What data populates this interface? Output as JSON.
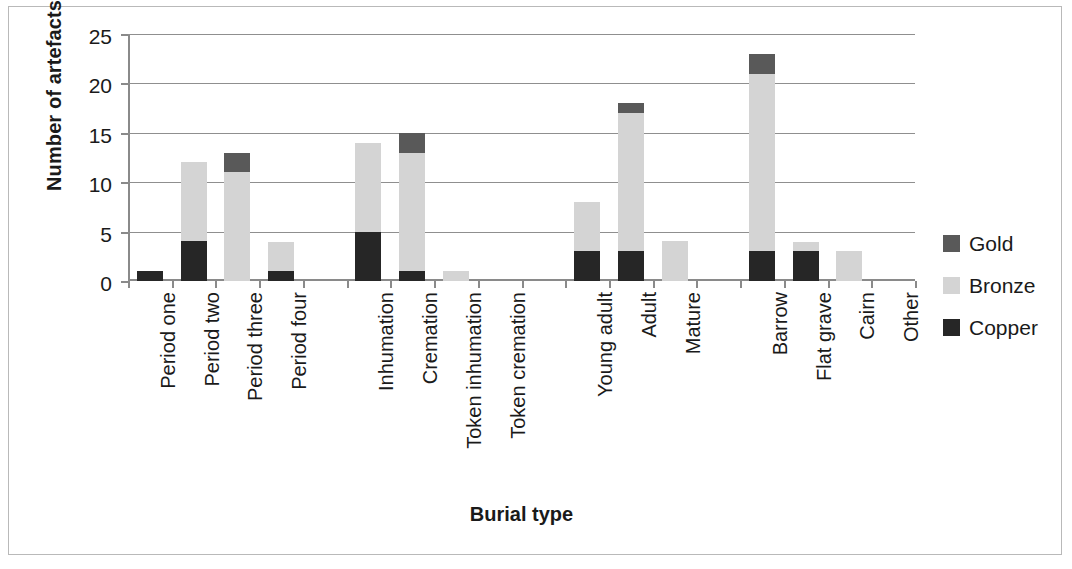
{
  "chart_data": {
    "type": "bar",
    "subtype": "stacked",
    "title": "",
    "xlabel": "Burial type",
    "ylabel": "Number of artefacts",
    "ylim": [
      0,
      25
    ],
    "yticks": [
      0,
      5,
      10,
      15,
      20,
      25
    ],
    "grid": true,
    "legend_position": "right",
    "categories": [
      "Period one",
      "Period two",
      "Period three",
      "Period four",
      "",
      "Inhumation",
      "Cremation",
      "Token inhumation",
      "Token cremation",
      "",
      "Young adult",
      "Adult",
      "Mature",
      "",
      "Barrow",
      "Flat grave",
      "Cairn",
      "Other"
    ],
    "series": [
      {
        "name": "Copper",
        "color": "#262626",
        "values": [
          1,
          4,
          0,
          1,
          0,
          5,
          1,
          0,
          0,
          0,
          3,
          3,
          0,
          0,
          3,
          3,
          0,
          0
        ]
      },
      {
        "name": "Bronze",
        "color": "#d4d4d4",
        "values": [
          0,
          8,
          11,
          3,
          0,
          9,
          12,
          1,
          0,
          0,
          5,
          14,
          4,
          0,
          18,
          1,
          3,
          0
        ]
      },
      {
        "name": "Gold",
        "color": "#595959",
        "values": [
          0,
          0,
          2,
          0,
          0,
          0,
          2,
          0,
          0,
          0,
          0,
          1,
          0,
          0,
          2,
          0,
          0,
          0
        ]
      }
    ],
    "totals": [
      1,
      12,
      13,
      4,
      0,
      14,
      15,
      1,
      0,
      0,
      8,
      18,
      4,
      0,
      23,
      4,
      3,
      0
    ]
  },
  "legend": {
    "entries": [
      {
        "label": "Gold",
        "color": "#595959"
      },
      {
        "label": "Bronze",
        "color": "#d4d4d4"
      },
      {
        "label": "Copper",
        "color": "#262626"
      }
    ]
  }
}
